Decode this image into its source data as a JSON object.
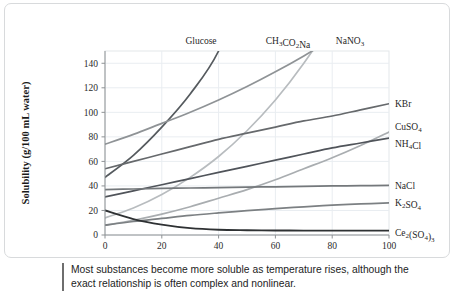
{
  "caption": {
    "text": "Most substances become more soluble as temperature rises, although the exact relationship is often complex and nonlinear."
  },
  "chart_data": {
    "type": "line",
    "title": "",
    "xlabel": "Temperature (°C)",
    "ylabel": "Solubility (g/100 mL water)",
    "xlim": [
      0,
      100
    ],
    "ylim": [
      0,
      150
    ],
    "xticks": [
      0,
      20,
      40,
      60,
      80,
      100
    ],
    "xtick_labels": [
      "0",
      "20",
      "40",
      "60",
      "80",
      "100"
    ],
    "yticks": [
      0,
      20,
      40,
      60,
      80,
      100,
      120,
      140
    ],
    "ytick_labels": [
      "0",
      "20",
      "40",
      "60",
      "80",
      "100",
      "120",
      "140"
    ],
    "grid": true,
    "legend": "inline-labels",
    "x": [
      0,
      10,
      20,
      30,
      40,
      50,
      60,
      70,
      80,
      90,
      100
    ],
    "series": [
      {
        "name": "Glucose",
        "label_html": "Glucose",
        "label_position": "top",
        "color": "#555a5e",
        "width": 1.7,
        "values": [
          47,
          65,
          88,
          115,
          150,
          210,
          290,
          400,
          540,
          700,
          900
        ],
        "clipped_above_ylim": true
      },
      {
        "name": "CH3CO2Na",
        "label_html": "CH<sub>3</sub>CO<sub>2</sub>Na",
        "label_position": "top",
        "color": "#b8bcbf",
        "width": 1.7,
        "values": [
          14,
          22,
          33,
          47,
          64,
          85,
          110,
          140,
          175,
          215,
          260
        ],
        "clipped_above_ylim": true
      },
      {
        "name": "NaNO3",
        "label_html": "NaNO<sub>3</sub>",
        "label_position": "top",
        "color": "#8f9396",
        "width": 1.7,
        "values": [
          74,
          82,
          91,
          100,
          110,
          121,
          133,
          146,
          160,
          175,
          192
        ],
        "clipped_above_ylim": true
      },
      {
        "name": "KBr",
        "label_html": "KBr",
        "label_position": "right",
        "color": "#66696c",
        "width": 1.7,
        "values": [
          54,
          60,
          66,
          72,
          78,
          83,
          88,
          93,
          97,
          102,
          107
        ]
      },
      {
        "name": "CuSO4",
        "label_html": "CuSO<sub>4</sub>",
        "label_position": "right",
        "color": "#a9adb0",
        "width": 1.7,
        "values": [
          8,
          12,
          17,
          23,
          30,
          37,
          45,
          54,
          63,
          73,
          84
        ]
      },
      {
        "name": "NH4Cl",
        "label_html": "NH<sub>4</sub>Cl",
        "label_position": "right",
        "color": "#50545a",
        "width": 1.7,
        "values": [
          31,
          36,
          41,
          46,
          51,
          56,
          61,
          66,
          71,
          75,
          79
        ]
      },
      {
        "name": "NaCl",
        "label_html": "NaCl",
        "label_position": "right",
        "color": "#74787b",
        "width": 1.7,
        "values": [
          37,
          37.5,
          38,
          38.3,
          38.6,
          39,
          39.3,
          39.6,
          40,
          40.2,
          40.5
        ]
      },
      {
        "name": "K2SO4",
        "label_html": "K<sub>2</sub>SO<sub>4</sub>",
        "label_position": "right",
        "color": "#7c8083",
        "width": 1.7,
        "values": [
          8,
          11,
          13.5,
          16,
          18,
          19.8,
          21.5,
          23,
          24.3,
          25.3,
          26.2
        ]
      },
      {
        "name": "Ce2(SO4)3",
        "label_html": "Ce<sub>2</sub>(SO<sub>4</sub>)<sub>3</sub>",
        "label_position": "right",
        "color": "#2e3133",
        "width": 1.9,
        "values": [
          20,
          13,
          8.5,
          5.6,
          4.3,
          3.9,
          3.7,
          3.6,
          3.6,
          3.6,
          3.6
        ]
      }
    ]
  },
  "plot_geometry": {
    "left": 100,
    "right": 384,
    "top": 47,
    "bottom": 231
  }
}
